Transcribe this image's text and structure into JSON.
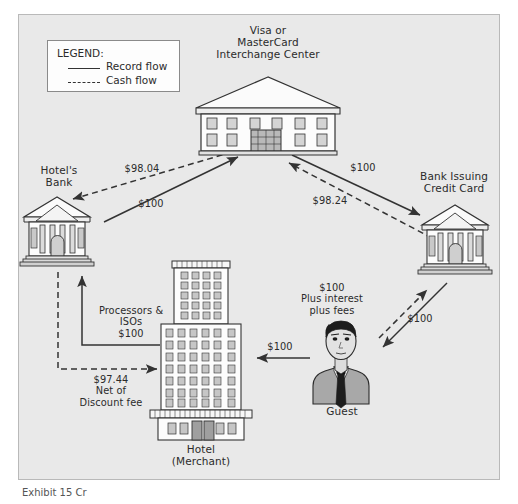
{
  "diagram": {
    "background_color": "#e9e9e9",
    "panel_border_color": "#b9b9b9",
    "line_color": "#333333"
  },
  "legend": {
    "title": "LEGEND:",
    "items": [
      {
        "style": "solid",
        "label": "Record flow"
      },
      {
        "style": "dashed",
        "label": "Cash flow"
      }
    ]
  },
  "nodes": {
    "interchange": {
      "label": "Visa or\nMasterCard\nInterchange Center",
      "icon": "interchange-building-icon"
    },
    "hotel_bank": {
      "label": "Hotel's\nBank",
      "icon": "bank-building-icon"
    },
    "issuing_bank": {
      "label": "Bank Issuing\nCredit Card",
      "icon": "bank-building-icon"
    },
    "hotel": {
      "label": "Hotel\n(Merchant)",
      "icon": "hotel-tower-icon"
    },
    "guest": {
      "label": "Guest",
      "icon": "guest-person-icon"
    }
  },
  "flows": {
    "interchange_to_hotel_bank_cash": "$98.04",
    "hotel_bank_to_interchange_record": "$100",
    "interchange_to_issuing_record": "$100",
    "issuing_to_interchange_cash": "$98.24",
    "hotel_to_hotel_bank_record": "Processors &\nISOs\n$100",
    "hotel_bank_to_hotel_cash": "$97.44\nNet of\nDiscount fee",
    "guest_to_issuing_cash": "$100\nPlus interest\nplus fees",
    "guest_to_issuing_record": "$100",
    "guest_to_hotel_record": "$100"
  },
  "caption": {
    "text": "Exhibit 15  Cr"
  }
}
